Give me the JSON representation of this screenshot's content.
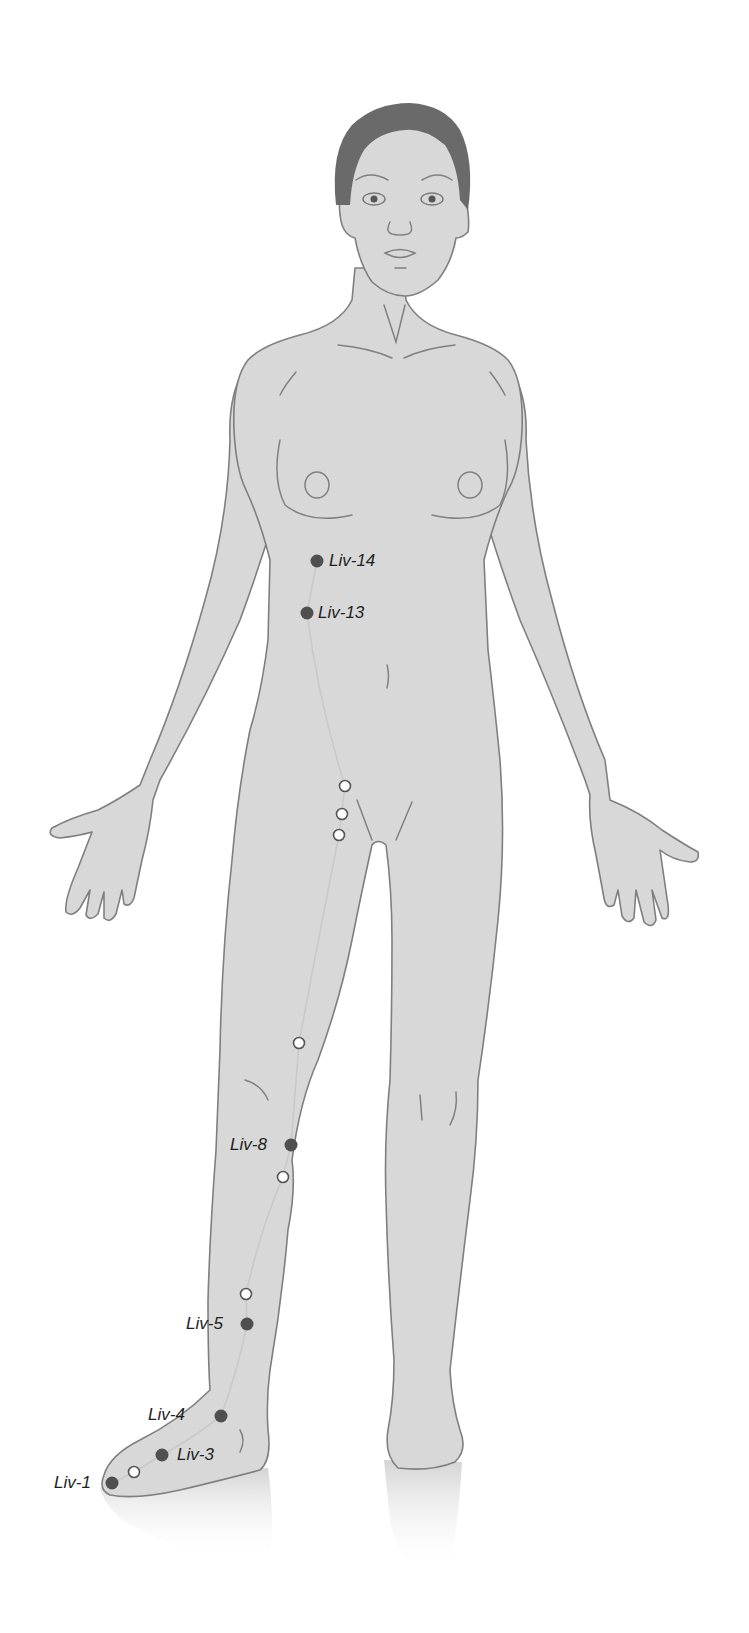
{
  "diagram": {
    "meridian": "Liver",
    "colors": {
      "skin": "#d8d8d8",
      "outline": "#7f7f7f",
      "hair": "#6a6a6a",
      "meridian_line": "#c9c9c9",
      "labeled_point": "#4f4f4f",
      "unlabeled_point": "#ffffff"
    },
    "points": {
      "liv14": {
        "label": "Liv-14",
        "x": 317,
        "y": 561,
        "type": "solid"
      },
      "liv13": {
        "label": "Liv-13",
        "x": 307,
        "y": 613,
        "type": "solid"
      },
      "liv8": {
        "label": "Liv-8",
        "x": 291,
        "y": 1145,
        "type": "solid"
      },
      "liv5": {
        "label": "Liv-5",
        "x": 247,
        "y": 1324,
        "type": "solid"
      },
      "liv4": {
        "label": "Liv-4",
        "x": 221,
        "y": 1416,
        "type": "solid"
      },
      "liv3": {
        "label": "Liv-3",
        "x": 162,
        "y": 1455,
        "type": "solid"
      },
      "liv1": {
        "label": "Liv-1",
        "x": 112,
        "y": 1483,
        "type": "solid"
      }
    },
    "unlabeled_points": [
      {
        "x": 345,
        "y": 786
      },
      {
        "x": 342,
        "y": 814
      },
      {
        "x": 339,
        "y": 835
      },
      {
        "x": 299,
        "y": 1043
      },
      {
        "x": 283,
        "y": 1177
      },
      {
        "x": 246,
        "y": 1294
      },
      {
        "x": 134,
        "y": 1472
      }
    ]
  }
}
